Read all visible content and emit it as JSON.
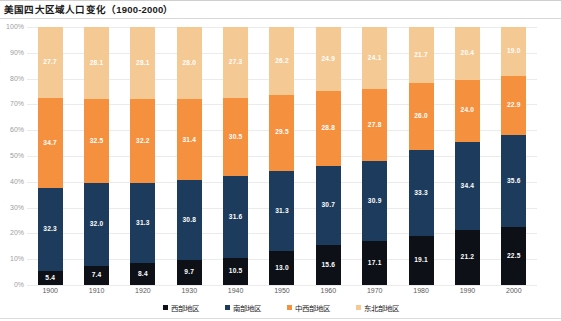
{
  "header": {
    "title": "美国四大区域人口变化（1900-2000）"
  },
  "chart_data": {
    "type": "bar",
    "stacked": true,
    "normalized": true,
    "title": "美国四大区域人口变化（1900-2000）",
    "xlabel": "",
    "ylabel": "",
    "ylim": [
      0,
      100
    ],
    "yticks": [
      "0%",
      "10%",
      "20%",
      "30%",
      "40%",
      "50%",
      "60%",
      "70%",
      "80%",
      "90%",
      "100%"
    ],
    "grid": true,
    "legend_position": "bottom",
    "categories": [
      "1900",
      "1910",
      "1920",
      "1930",
      "1940",
      "1950",
      "1960",
      "1970",
      "1980",
      "1990",
      "2000"
    ],
    "series": [
      {
        "name": "西部地区",
        "color": "#0d1117",
        "values": [
          5.4,
          7.4,
          8.4,
          9.7,
          10.5,
          13.0,
          15.6,
          17.1,
          19.1,
          21.2,
          22.5
        ]
      },
      {
        "name": "南部地区",
        "color": "#1d3b5c",
        "values": [
          32.3,
          32.0,
          31.3,
          30.8,
          31.6,
          31.3,
          30.7,
          30.9,
          33.3,
          34.4,
          35.6
        ]
      },
      {
        "name": "中西部地区",
        "color": "#f5913e",
        "values": [
          34.7,
          32.5,
          32.2,
          31.4,
          30.5,
          29.5,
          28.8,
          27.8,
          26.0,
          24.0,
          22.9
        ]
      },
      {
        "name": "东北部地区",
        "color": "#f5c993",
        "values": [
          27.7,
          28.1,
          28.1,
          28.0,
          27.3,
          26.2,
          24.9,
          24.1,
          21.7,
          20.4,
          19.0
        ]
      }
    ]
  },
  "legend": {
    "items": [
      {
        "label": "西部地区",
        "color": "#0d1117"
      },
      {
        "label": "南部地区",
        "color": "#1d3b5c"
      },
      {
        "label": "中西部地区",
        "color": "#f5913e"
      },
      {
        "label": "东北部地区",
        "color": "#f5c993"
      }
    ]
  }
}
